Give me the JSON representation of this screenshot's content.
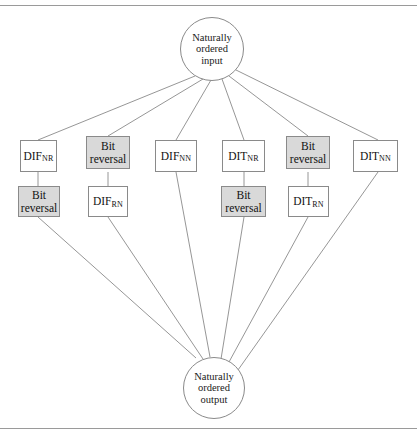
{
  "figure": {
    "type": "fft-algorithm-flow-diagram",
    "input_node": {
      "lines": [
        "Naturally",
        "ordered",
        "input"
      ]
    },
    "output_node": {
      "lines": [
        "Naturally",
        "ordered",
        "output"
      ]
    },
    "columns": [
      {
        "id": "col1",
        "stage1": {
          "kind": "algorithm",
          "main": "DIF",
          "sub": "NR",
          "shaded": false
        },
        "stage2": {
          "kind": "bit-reversal",
          "line1": "Bit",
          "line2": "reversal",
          "shaded": true
        }
      },
      {
        "id": "col2",
        "stage1": {
          "kind": "bit-reversal",
          "line1": "Bit",
          "line2": "reversal",
          "shaded": true
        },
        "stage2": {
          "kind": "algorithm",
          "main": "DIF",
          "sub": "RN",
          "shaded": false
        }
      },
      {
        "id": "col3",
        "stage1": {
          "kind": "algorithm",
          "main": "DIF",
          "sub": "NN",
          "shaded": false
        },
        "stage2": null
      },
      {
        "id": "col4",
        "stage1": {
          "kind": "algorithm",
          "main": "DIT",
          "sub": "NR",
          "shaded": false
        },
        "stage2": {
          "kind": "bit-reversal",
          "line1": "Bit",
          "line2": "reversal",
          "shaded": true
        }
      },
      {
        "id": "col5",
        "stage1": {
          "kind": "bit-reversal",
          "line1": "Bit",
          "line2": "reversal",
          "shaded": true
        },
        "stage2": {
          "kind": "algorithm",
          "main": "DIT",
          "sub": "RN",
          "shaded": false
        }
      },
      {
        "id": "col6",
        "stage1": {
          "kind": "algorithm",
          "main": "DIT",
          "sub": "NN",
          "shaded": false
        },
        "stage2": null
      }
    ],
    "colors": {
      "shaded_fill": "#d9d9d9",
      "line": "#8a8a8a",
      "text": "#111111",
      "background": "#ffffff"
    }
  }
}
